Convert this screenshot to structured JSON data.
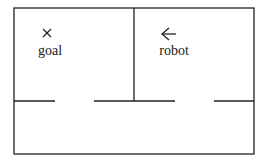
{
  "diagram": {
    "type": "floor-plan",
    "colors": {
      "wall": "#222222",
      "text": "#1a1a1a",
      "background": "#ffffff"
    },
    "outer_wall": {
      "x": 14,
      "y": 8,
      "width": 240,
      "height": 146
    },
    "divider": {
      "x": 134,
      "y1": 8,
      "y2": 101
    },
    "bottom_wall_segments": [
      {
        "x1": 14,
        "x2": 55,
        "y": 101
      },
      {
        "x1": 94,
        "x2": 175,
        "y": 101
      },
      {
        "x1": 214,
        "x2": 254,
        "y": 101
      }
    ],
    "markers": [
      {
        "name": "goal",
        "glyph": "×",
        "label": "goal",
        "x": 47,
        "y": 33,
        "label_x": 50,
        "label_y": 55
      },
      {
        "name": "robot",
        "glyph": "←",
        "label": "robot",
        "x": 168,
        "y": 34,
        "label_x": 174,
        "label_y": 55
      }
    ]
  }
}
